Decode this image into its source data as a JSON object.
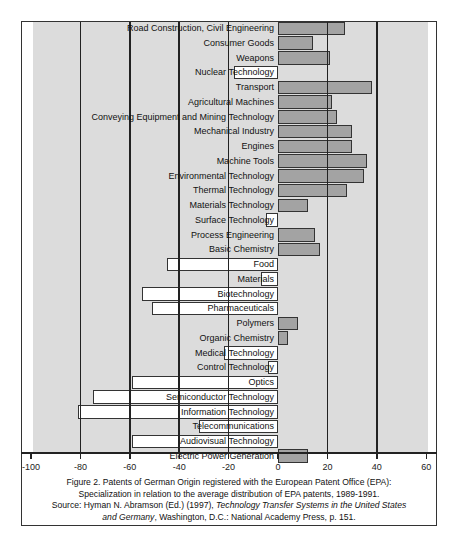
{
  "chart_data": {
    "type": "bar",
    "orientation": "horizontal",
    "title": "",
    "xlabel": "",
    "ylabel": "",
    "xlim": [
      -100,
      60
    ],
    "xticks": [
      -100,
      -80,
      -60,
      -40,
      -20,
      0,
      20,
      40,
      60
    ],
    "xtick_labels": [
      "-100",
      "-80",
      "-60",
      "-40",
      "-20",
      "0",
      "20",
      "40",
      "60"
    ],
    "gridlines_x": [
      -80,
      -60,
      -40,
      -20,
      20,
      40
    ],
    "grid": true,
    "legend": null,
    "positive_color": "#a3a3a3",
    "negative_color": "#ffffff",
    "background_color": "#dcdcdc",
    "categories": [
      "Road Construction, Civil Engineering",
      "Consumer Goods",
      "Weapons",
      "Nuclear Technology",
      "Transport",
      "Agricultural Machines",
      "Conveying Equipment and Mining Technology",
      "Mechanical Industry",
      "Engines",
      "Machine Tools",
      "Environmental Technology",
      "Thermal Technology",
      "Materials Technology",
      "Surface Technology",
      "Process Engineering",
      "Basic Chemistry",
      "Food",
      "Materials",
      "Biotechnology",
      "Pharmaceuticals",
      "Polymers",
      "Organic Chemistry",
      "Medical Technology",
      "Control Technology",
      "Optics",
      "Semiconductor Technology",
      "Information Technology",
      "Telecommunications",
      "Audiovisual Technology",
      "Electric Power Generation"
    ],
    "values": [
      27,
      14,
      21,
      -18,
      38,
      22,
      24,
      30,
      30,
      36,
      35,
      28,
      12,
      -5,
      15,
      17,
      -45,
      -7,
      -55,
      -51,
      8,
      4,
      -22,
      -4,
      -59,
      -75,
      -81,
      -32,
      -59,
      12
    ]
  },
  "caption": {
    "line1": "Figure 2. Patents of German Origin registered with the European Patent Office (EPA):",
    "line2": "Specialization in relation to the average distribution of EPA patents, 1989-1991.",
    "line3_prefix": "Source: Hyman N. Abramson (Ed.) (1997), ",
    "line3_italic": "Technology Transfer Systems in the United States",
    "line4_italic": "and Germany",
    "line4_suffix": ", Washington, D.C.: National Academy Press, p. 151."
  }
}
